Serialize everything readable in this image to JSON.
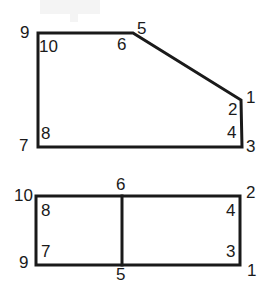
{
  "figure": {
    "background_color": "#ffffff",
    "stroke_color": "#1a1a1a",
    "label_color": "#1a1a1a",
    "stroke_width": 3,
    "shapes": [
      {
        "name": "upper-polygon",
        "type": "polygon",
        "description": "Irregular pentagon: rectangle with chamfered top-right corner",
        "points": "38,33 133,33 241,100 242,147 38,147",
        "closed": true
      },
      {
        "name": "lower-rectangle",
        "type": "rect",
        "description": "Rectangle divided by one vertical line into two cells",
        "points": "36,196 240,196 240,265 36,265",
        "closed": true
      },
      {
        "name": "lower-rectangle-divider",
        "type": "line",
        "description": "Vertical divider line splitting the lower rectangle",
        "points": "122,196 122,265",
        "closed": false
      }
    ],
    "upper_labels": [
      {
        "text": "9",
        "x": 20,
        "y": 24
      },
      {
        "text": "10",
        "x": 39,
        "y": 38
      },
      {
        "text": "6",
        "x": 117,
        "y": 36
      },
      {
        "text": "5",
        "x": 137,
        "y": 20
      },
      {
        "text": "1",
        "x": 246,
        "y": 89
      },
      {
        "text": "2",
        "x": 228,
        "y": 101
      },
      {
        "text": "4",
        "x": 227,
        "y": 124
      },
      {
        "text": "3",
        "x": 246,
        "y": 138
      },
      {
        "text": "8",
        "x": 41,
        "y": 125
      },
      {
        "text": "7",
        "x": 19,
        "y": 137
      }
    ],
    "lower_labels": [
      {
        "text": "10",
        "x": 14,
        "y": 187
      },
      {
        "text": "6",
        "x": 116,
        "y": 176
      },
      {
        "text": "2",
        "x": 246,
        "y": 184
      },
      {
        "text": "8",
        "x": 41,
        "y": 202
      },
      {
        "text": "4",
        "x": 226,
        "y": 202
      },
      {
        "text": "7",
        "x": 41,
        "y": 243
      },
      {
        "text": "3",
        "x": 226,
        "y": 243
      },
      {
        "text": "9",
        "x": 19,
        "y": 254
      },
      {
        "text": "5",
        "x": 116,
        "y": 266
      },
      {
        "text": "1",
        "x": 247,
        "y": 262
      }
    ]
  }
}
